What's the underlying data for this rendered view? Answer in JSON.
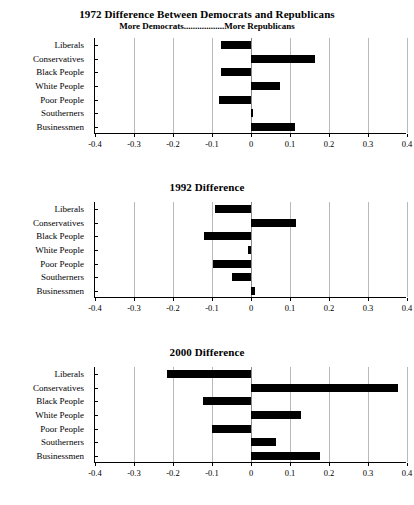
{
  "figure": {
    "categories": [
      "Liberals",
      "Conservatives",
      "Black People",
      "White People",
      "Poor People",
      "Southerners",
      "Businessmen"
    ],
    "xticks": [
      "-0.4",
      "-0.3",
      "-0.2",
      "-0.1",
      "0",
      "0.1",
      "0.2",
      "0.3",
      "0.4"
    ],
    "xtick_values": [
      -0.4,
      -0.3,
      -0.2,
      -0.1,
      0,
      0.1,
      0.2,
      0.3,
      0.4
    ],
    "bar_color": "#000000",
    "grid_color": "#b9b9b9",
    "axis_color": "#000000"
  },
  "panels": [
    {
      "title": "1972 Difference Between Democrats and Republicans",
      "subtitle": "More Democrats..................More Republicans"
    },
    {
      "title": "1992 Difference",
      "subtitle": ""
    },
    {
      "title": "2000 Difference",
      "subtitle": ""
    }
  ],
  "chart_data": [
    {
      "type": "bar",
      "orientation": "horizontal",
      "title": "1972 Difference Between Democrats and Republicans",
      "subtitle": "More Democrats..................More Republicans",
      "xlabel": "",
      "ylabel": "",
      "xlim": [
        -0.4,
        0.4
      ],
      "xticks": [
        -0.4,
        -0.3,
        -0.2,
        -0.1,
        0,
        0.1,
        0.2,
        0.3,
        0.4
      ],
      "grid": true,
      "legend": "none",
      "categories": [
        "Liberals",
        "Conservatives",
        "Black People",
        "White People",
        "Poor People",
        "Southerners",
        "Businessmen"
      ],
      "values": [
        -0.077,
        0.163,
        -0.077,
        0.075,
        -0.082,
        0.005,
        0.112
      ]
    },
    {
      "type": "bar",
      "orientation": "horizontal",
      "title": "1992 Difference",
      "subtitle": "",
      "xlabel": "",
      "ylabel": "",
      "xlim": [
        -0.4,
        0.4
      ],
      "xticks": [
        -0.4,
        -0.3,
        -0.2,
        -0.1,
        0,
        0.1,
        0.2,
        0.3,
        0.4
      ],
      "grid": true,
      "legend": "none",
      "categories": [
        "Liberals",
        "Conservatives",
        "Black People",
        "White People",
        "Poor People",
        "Southerners",
        "Businessmen"
      ],
      "values": [
        -0.092,
        0.115,
        -0.12,
        -0.008,
        -0.098,
        -0.05,
        0.01
      ]
    },
    {
      "type": "bar",
      "orientation": "horizontal",
      "title": "2000 Difference",
      "subtitle": "",
      "xlabel": "",
      "ylabel": "",
      "xlim": [
        -0.4,
        0.4
      ],
      "xticks": [
        -0.4,
        -0.3,
        -0.2,
        -0.1,
        0,
        0.1,
        0.2,
        0.3,
        0.4
      ],
      "grid": true,
      "legend": "none",
      "categories": [
        "Liberals",
        "Conservatives",
        "Black People",
        "White People",
        "Poor People",
        "Southerners",
        "Businessmen"
      ],
      "values": [
        -0.215,
        0.377,
        -0.122,
        0.128,
        -0.1,
        0.065,
        0.177
      ]
    }
  ]
}
